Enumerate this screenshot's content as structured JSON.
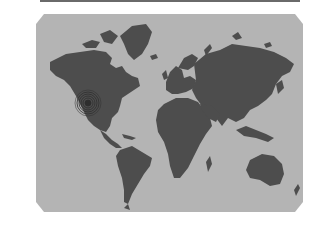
{
  "image": {
    "subject": "world map",
    "description": "Gray world map with a concentric ripple marker over central North America",
    "colors": {
      "background": "#ffffff",
      "ocean": "#b4b4b4",
      "land": "#4d4d4d",
      "top_bar": "#6a6a6a",
      "marker": "#2e2e2e"
    }
  },
  "marker": {
    "label": "",
    "location": "central North America"
  }
}
